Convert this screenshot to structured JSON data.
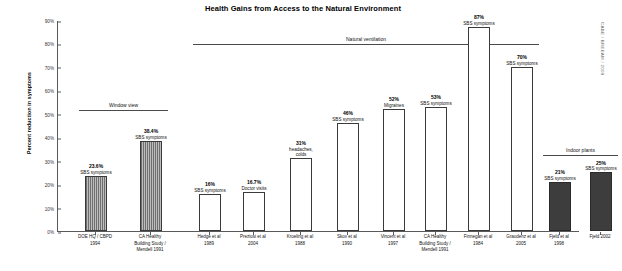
{
  "chart_data": {
    "type": "bar",
    "title": "Health Gains from Access to the Natural Environment",
    "xlabel": "",
    "ylabel": "Percent reduction in symptoms",
    "ylim": [
      0,
      90
    ],
    "ytick_labels": [
      "0%",
      "10%",
      "20%",
      "30%",
      "40%",
      "50%",
      "60%",
      "70%",
      "80%",
      "90%"
    ],
    "ytick_values": [
      0,
      10,
      20,
      30,
      40,
      50,
      60,
      70,
      80,
      90
    ],
    "grid": false,
    "legend": "none",
    "credit": "CABE / BREEAM / 2009",
    "group_labels": [
      "Window view",
      "Natural ventilation",
      "Indoor plants"
    ],
    "categories": [
      "DOE HQ / CBPD 1994",
      "CA Healthy Building Study / Mendell 1991",
      "Hedge et al 1989",
      "Preziosi et al 2004",
      "Kroeling et al 1988",
      "Skov et al 1990",
      "Vincent et al 1997",
      "CA Healthy Building Study / Mendell 1991",
      "Finnegan et al 1984",
      "Graudenz et al 2005",
      "Fjeld et al 1998",
      "Fjeld 2002"
    ],
    "values": [
      23.6,
      38.4,
      16,
      16.7,
      31,
      46,
      52,
      53,
      87,
      70,
      21,
      25
    ],
    "value_labels": [
      "23.6%",
      "38.4%",
      "16%",
      "16.7%",
      "31%",
      "46%",
      "52%",
      "53%",
      "87%",
      "70%",
      "21%",
      "25%"
    ],
    "conditions": [
      "SBS symptoms",
      "SBS symptoms",
      "SBS symptoms",
      "Doctor visits",
      "headaches, colds",
      "SBS symptoms",
      "Migraines",
      "SBS symptoms",
      "SBS symptoms",
      "SBS symptoms",
      "SBS symptoms",
      "SBS symptoms"
    ],
    "groups": [
      {
        "label": "Window view",
        "bars": [
          0,
          1
        ],
        "style": "hatch"
      },
      {
        "label": "Natural ventilation",
        "bars": [
          2,
          3,
          4,
          5,
          6,
          7,
          8,
          9
        ],
        "style": "open"
      },
      {
        "label": "Indoor plants",
        "bars": [
          10,
          11
        ],
        "style": "solid"
      }
    ]
  },
  "bars": [
    {
      "label_lines": [
        "DOE HQ / CBPD",
        "1994"
      ],
      "value_label": "23.6%",
      "condition_lines": [
        "SBS symptoms"
      ],
      "value": 23.6,
      "style": "hatch"
    },
    {
      "label_lines": [
        "CA Healthy",
        "Building Study /",
        "Mendell 1991"
      ],
      "value_label": "38.4%",
      "condition_lines": [
        "SBS symptoms"
      ],
      "value": 38.4,
      "style": "hatch"
    },
    {
      "label_lines": [
        "Hedge et al",
        "1989"
      ],
      "value_label": "16%",
      "condition_lines": [
        "SBS symptoms"
      ],
      "value": 16,
      "style": "open"
    },
    {
      "label_lines": [
        "Preziosi et al",
        "2004"
      ],
      "value_label": "16.7%",
      "condition_lines": [
        "Doctor visits"
      ],
      "value": 16.7,
      "style": "open"
    },
    {
      "label_lines": [
        "Kroeling et al",
        "1988"
      ],
      "value_label": "31%",
      "condition_lines": [
        "headaches,",
        "colds"
      ],
      "value": 31,
      "style": "open"
    },
    {
      "label_lines": [
        "Skov et al",
        "1990"
      ],
      "value_label": "46%",
      "condition_lines": [
        "SBS symptoms"
      ],
      "value": 46,
      "style": "open"
    },
    {
      "label_lines": [
        "Vincent et al",
        "1997"
      ],
      "value_label": "52%",
      "condition_lines": [
        "Migraines"
      ],
      "value": 52,
      "style": "open"
    },
    {
      "label_lines": [
        "CA Healthy",
        "Building Study /",
        "Mendell 1991"
      ],
      "value_label": "53%",
      "condition_lines": [
        "SBS symptoms"
      ],
      "value": 53,
      "style": "open"
    },
    {
      "label_lines": [
        "Finnegan et al",
        "1984"
      ],
      "value_label": "87%",
      "condition_lines": [
        "SBS symptoms"
      ],
      "value": 87,
      "style": "open"
    },
    {
      "label_lines": [
        "Graudenz et al",
        "2005"
      ],
      "value_label": "70%",
      "condition_lines": [
        "SBS symptoms"
      ],
      "value": 70,
      "style": "open"
    },
    {
      "label_lines": [
        "Fjeld et al",
        "1998"
      ],
      "value_label": "21%",
      "condition_lines": [
        "SBS symptoms"
      ],
      "value": 21,
      "style": "solid"
    },
    {
      "label_lines": [
        "Fjeld 2002"
      ],
      "value_label": "25%",
      "condition_lines": [
        "SBS symptoms"
      ],
      "value": 25,
      "style": "solid"
    }
  ],
  "colors": {
    "axis": "#5a5a5a",
    "bar_outline": "#3a3a3a",
    "bar_solid": "#3d3d3d",
    "hatch_dark": "#6f6f6f",
    "hatch_light": "#bdbdbd",
    "text": "#111111",
    "background": "#ffffff"
  }
}
